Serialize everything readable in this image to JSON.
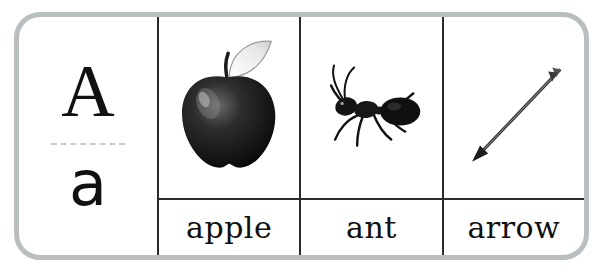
{
  "card": {
    "letter_uppercase": "A",
    "letter_lowercase": "a",
    "border_color": "#b9bfc0",
    "rule_color": "#2b2b2b",
    "text_color": "#111111"
  },
  "columns": [
    {
      "word": "apple",
      "picture": "apple-illustration"
    },
    {
      "word": "ant",
      "picture": "ant-illustration"
    },
    {
      "word": "arrow",
      "picture": "arrow-illustration"
    }
  ]
}
